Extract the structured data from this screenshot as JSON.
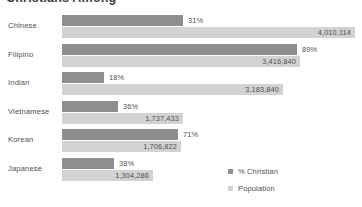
{
  "chart_data": {
    "type": "bar",
    "title": "Christians Among",
    "orientation": "horizontal",
    "grouping": "grouped",
    "categories": [
      "Chinese",
      "Filipino",
      "Indian",
      "Vietnamese",
      "Korean",
      "Japanese"
    ],
    "series": [
      {
        "name": "% Christian",
        "unit": "percent",
        "color": "#8e8e8e",
        "values": [
          31,
          89,
          18,
          36,
          71,
          38
        ],
        "value_labels": [
          "31%",
          "89%",
          "18%",
          "36%",
          "71%",
          "38%"
        ]
      },
      {
        "name": "Population",
        "unit": "people",
        "color": "#d2d2d2",
        "values": [
          4010114,
          3416840,
          3183840,
          1737433,
          1706822,
          1304286
        ],
        "value_labels": [
          "4,010,114",
          "3,416,840",
          "3,183,840",
          "1,737,433",
          "1,706,822",
          "1,304,286"
        ]
      }
    ],
    "legend": {
      "position": "bottom-right",
      "entries": [
        {
          "label": "% Christian",
          "color": "#8e8e8e"
        },
        {
          "label": "Population",
          "color": "#d2d2d2"
        }
      ]
    },
    "xlabel": "",
    "ylabel": "",
    "grid": false,
    "axis_visible": false
  },
  "rows": [
    {
      "category": "Chinese",
      "pct_label": "31%",
      "pct_width": 121,
      "pop_label": "4,010,114",
      "pop_width": 293
    },
    {
      "category": "Filipino",
      "pct_label": "89%",
      "pct_width": 235,
      "pop_label": "3,416,840",
      "pop_width": 238
    },
    {
      "category": "Indian",
      "pct_label": "18%",
      "pct_width": 42,
      "pop_label": "3,183,840",
      "pop_width": 221
    },
    {
      "category": "Vietnamese",
      "pct_label": "36%",
      "pct_width": 56,
      "pop_label": "1,737,433",
      "pop_width": 121
    },
    {
      "category": "Korean",
      "pct_label": "71%",
      "pct_width": 116,
      "pop_label": "1,706,822",
      "pop_width": 119
    },
    {
      "category": "Japanese",
      "pct_label": "38%",
      "pct_width": 52,
      "pop_label": "1,304,286",
      "pop_width": 91
    }
  ]
}
